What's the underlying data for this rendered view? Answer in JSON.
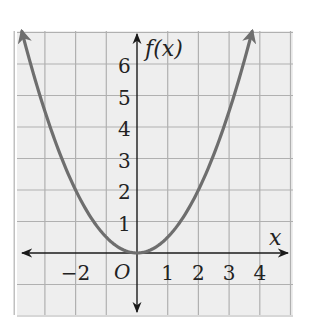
{
  "chart_data": {
    "type": "line",
    "title": "",
    "function": "f(x) = 0.5 x^2",
    "xlabel": "x",
    "ylabel": "f(x)",
    "origin_label": "O",
    "x_tick_labels": [
      "−2",
      "1",
      "2",
      "3",
      "4"
    ],
    "x_tick_values": [
      -2,
      1,
      2,
      3,
      4
    ],
    "y_tick_labels": [
      "1",
      "2",
      "3",
      "4",
      "5",
      "6"
    ],
    "y_tick_values": [
      1,
      2,
      3,
      4,
      5,
      6
    ],
    "xlim": [
      -4,
      5
    ],
    "ylim": [
      -2,
      7
    ],
    "grid": true,
    "legend": null,
    "series": [
      {
        "name": "f(x)",
        "x": [
          -3.75,
          -3,
          -2,
          -1,
          0,
          1,
          2,
          3,
          3.75
        ],
        "values": [
          7.03,
          4.5,
          2,
          0.5,
          0,
          0.5,
          2,
          4.5,
          7.03
        ],
        "arrows_at_ends": true
      }
    ]
  },
  "colors": {
    "background": "#eeeeee",
    "grid": "#b0b0b0",
    "axis": "#1a1a1a",
    "curve": "#6e6e6e",
    "text": "#222222"
  }
}
